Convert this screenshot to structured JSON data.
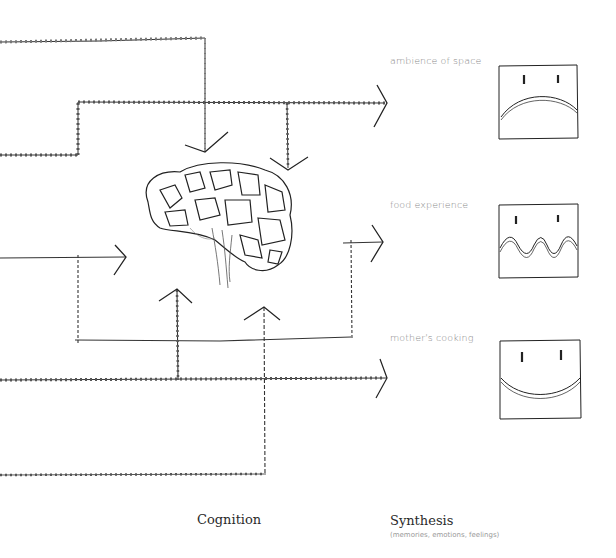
{
  "diagram": {
    "inputs": [
      {
        "label": "ambience of space",
        "face": "sad",
        "mouth": "frown"
      },
      {
        "label": "food experience",
        "face": "neutral",
        "mouth": "wavy"
      },
      {
        "label": "mother's cooking",
        "face": "happy",
        "mouth": "smile"
      }
    ],
    "center_icon": "brain-icon",
    "columns": {
      "cognition": "Cognition",
      "synthesis": "Synthesis",
      "synthesis_sub": "(memories, emotions, feelings)"
    },
    "colors": {
      "line": "#2b2b2b",
      "label": "#8a8a8a",
      "title": "#2a2a2a"
    }
  }
}
